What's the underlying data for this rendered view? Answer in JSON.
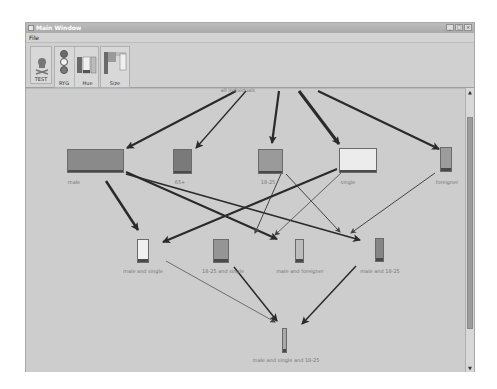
{
  "window": {
    "title": "Main Window",
    "controls": [
      "_",
      "□",
      "×"
    ]
  },
  "menu": {
    "items": [
      {
        "label": "File"
      }
    ]
  },
  "toolbar": {
    "buttons": [
      {
        "label": "TEST",
        "icon": "skull-icon"
      },
      {
        "label": "RYG",
        "icon": "traffic-light-icon"
      },
      {
        "label": "Hue",
        "icon": "hue-bars-icon"
      },
      {
        "label": "Size",
        "icon": "size-bars-icon"
      }
    ]
  },
  "graph": {
    "root_label": "all individuals",
    "nodes": [
      {
        "id": "male",
        "label": "male",
        "fill": "#8a8a8a"
      },
      {
        "id": "65plus",
        "label": "65+",
        "fill": "#7a7a7a"
      },
      {
        "id": "18-25",
        "label": "18-25",
        "fill": "#9a9a9a"
      },
      {
        "id": "single",
        "label": "single",
        "fill": "#ececec"
      },
      {
        "id": "foreigner",
        "label": "foreigner",
        "fill": "#9c9c9c"
      },
      {
        "id": "male-single",
        "label": "male and single",
        "fill": "#f0f0f0"
      },
      {
        "id": "18-25-single",
        "label": "18-25 and single",
        "fill": "#959595"
      },
      {
        "id": "male-foreigner",
        "label": "male and foreigner",
        "fill": "#bcbcbc"
      },
      {
        "id": "male-18-25",
        "label": "male and 18-25",
        "fill": "#858585"
      },
      {
        "id": "male-single-18-25",
        "label": "male and single and 18-25",
        "fill": "#a8a8a8"
      }
    ]
  },
  "scrollbar": {
    "up": "▲",
    "down": "▼"
  }
}
